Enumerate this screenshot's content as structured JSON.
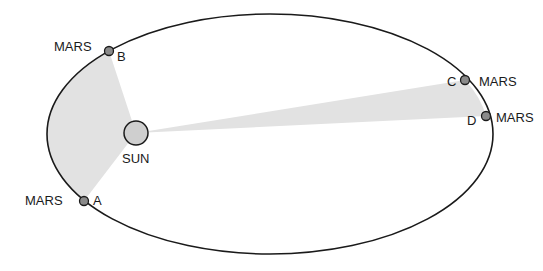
{
  "diagram": {
    "orbit": {
      "cx": 270,
      "cy": 134,
      "rx": 223,
      "ry": 120,
      "stroke": "#1a1a1a"
    },
    "sun": {
      "label": "SUN",
      "cx": 136,
      "cy": 133,
      "r": 12,
      "fill": "#cfcfcf"
    },
    "sector_fill": "#e2e2e2",
    "planets": [
      {
        "id": "A",
        "letter": "A",
        "name": "MARS",
        "x": 84,
        "y": 201
      },
      {
        "id": "B",
        "letter": "B",
        "name": "MARS",
        "x": 109,
        "y": 51
      },
      {
        "id": "C",
        "letter": "C",
        "name": "MARS",
        "x": 465,
        "y": 80
      },
      {
        "id": "D",
        "letter": "D",
        "name": "MARS",
        "x": 486,
        "y": 116
      }
    ],
    "planet_fill": "#8a8a8a"
  }
}
